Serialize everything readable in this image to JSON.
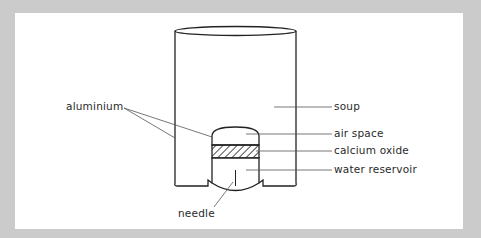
{
  "diagram": {
    "type": "labelled cross-section",
    "labels": {
      "aluminium": "aluminium",
      "soup": "soup",
      "air_space": "air space",
      "calcium_oxide": "calcium oxide",
      "water_reservoir": "water reservoir",
      "needle": "needle"
    },
    "colors": {
      "background_border": "#cbcbcb",
      "panel": "#ffffff",
      "stroke": "#222222",
      "leader": "#555555",
      "text": "#2a2a2a"
    }
  }
}
